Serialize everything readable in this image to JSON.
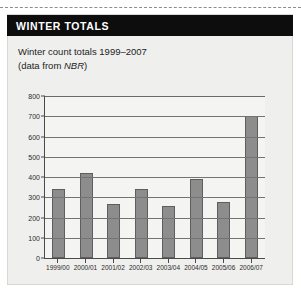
{
  "cut_line": "dashed-cut-line",
  "panel": {
    "header": {
      "title": "WINTER TOTALS"
    },
    "subtitle_line1": "Winter count totals 1999–2007",
    "subtitle_line2_prefix": "(data from ",
    "subtitle_line2_source": "NBR",
    "subtitle_line2_suffix": ")"
  },
  "colors": {
    "header_bg": "#0d0d0d",
    "header_text": "#ffffff",
    "panel_bg": "#efefee",
    "plot_bg": "#f4f4f3",
    "bar_fill": "#8d8d8d",
    "bar_stroke": "#5e5e5e",
    "grid": "#737373",
    "axis": "#4a4a4a"
  },
  "chart_data": {
    "type": "bar",
    "title": "Winter count totals 1999–2007",
    "subtitle": "(data from NBR)",
    "xlabel": "",
    "ylabel": "",
    "ylim": [
      0,
      800
    ],
    "ytick_step": 100,
    "yticks": [
      0,
      100,
      200,
      300,
      400,
      500,
      600,
      700,
      800
    ],
    "ytick_labels": [
      "0",
      "100",
      "200",
      "300",
      "400",
      "500",
      "600",
      "700",
      "800"
    ],
    "grid": true,
    "legend": false,
    "categories": [
      "1999/00",
      "2000/01",
      "2001/02",
      "2002/03",
      "2003/04",
      "2004/05",
      "2005/06",
      "2006/07"
    ],
    "values": [
      340,
      420,
      265,
      340,
      258,
      390,
      275,
      700
    ]
  }
}
